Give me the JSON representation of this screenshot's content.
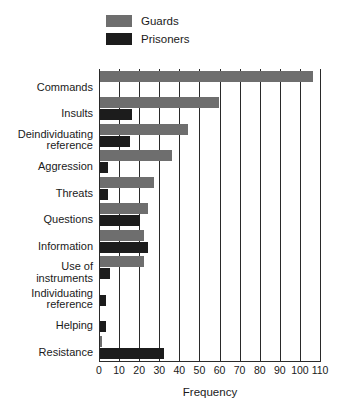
{
  "chart_data": {
    "type": "bar",
    "orientation": "horizontal",
    "title": "",
    "xlabel": "Frequency",
    "ylabel": "",
    "xlim": [
      0,
      110
    ],
    "xticks": [
      0,
      10,
      20,
      30,
      40,
      50,
      60,
      70,
      80,
      90,
      100,
      110
    ],
    "xtick_labels": [
      "0",
      "10",
      "20",
      "30",
      "40",
      "50",
      "60",
      "70",
      "80",
      "90",
      "100",
      "110"
    ],
    "grid": "vertical",
    "legend_position": "top-center",
    "categories": [
      "Commands",
      "Insults",
      "Deindividuating\nreference",
      "Aggression",
      "Threats",
      "Questions",
      "Information",
      "Use of\ninstruments",
      "Individuating\nreference",
      "Helping",
      "Resistance"
    ],
    "series": [
      {
        "name": "Guards",
        "color": "#6e6e6e",
        "values": [
          106,
          59,
          44,
          36,
          27,
          24,
          22,
          22,
          0,
          0,
          1
        ]
      },
      {
        "name": "Prisoners",
        "color": "#1c1c1c",
        "values": [
          0,
          16,
          15,
          4,
          4,
          20,
          24,
          5,
          3,
          3,
          32
        ]
      }
    ]
  },
  "legend": {
    "items": [
      {
        "label": "Guards",
        "color": "#6e6e6e"
      },
      {
        "label": "Prisoners",
        "color": "#1c1c1c"
      }
    ]
  },
  "axis": {
    "x_title": "Frequency"
  }
}
